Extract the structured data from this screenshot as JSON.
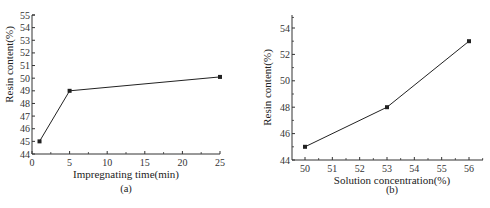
{
  "chart_data": [
    {
      "type": "line",
      "panel_label": "(a)",
      "title": "",
      "xlabel": "Impregnating time(min)",
      "ylabel": "Resin content(%)",
      "xlim": [
        0,
        25
      ],
      "ylim": [
        44,
        55
      ],
      "xticks": [
        0,
        5,
        10,
        15,
        20,
        25
      ],
      "yticks": [
        44,
        45,
        46,
        47,
        48,
        49,
        50,
        51,
        52,
        53,
        54,
        55
      ],
      "grid": false,
      "legend": null,
      "series": [
        {
          "name": "Resin content",
          "marker": "square",
          "x": [
            1,
            5,
            25
          ],
          "y": [
            45,
            49,
            50.1
          ]
        }
      ]
    },
    {
      "type": "line",
      "panel_label": "(b)",
      "title": "",
      "xlabel": "Solution concentration(%)",
      "ylabel": "Resin content(%)",
      "xlim": [
        49.5,
        56.5
      ],
      "ylim": [
        44,
        55
      ],
      "xticks": [
        50,
        51,
        52,
        53,
        54,
        55,
        56
      ],
      "yticks": [
        44,
        46,
        48,
        50,
        52,
        54
      ],
      "grid": false,
      "legend": null,
      "series": [
        {
          "name": "Resin content",
          "marker": "square",
          "x": [
            50,
            53,
            56
          ],
          "y": [
            45,
            48,
            53
          ]
        }
      ]
    }
  ],
  "colors": {
    "line": "#222222",
    "axis": "#333333",
    "background": "#ffffff"
  }
}
